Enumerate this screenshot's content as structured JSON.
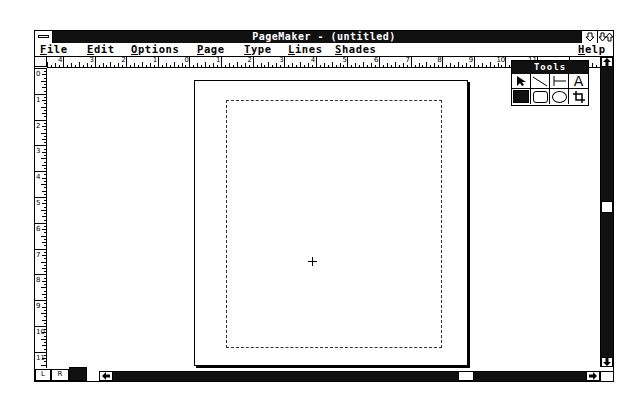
{
  "window": {
    "title": "PageMaker - (untitled)",
    "minimize_icon": "arrow-down",
    "maximize_icon": "arrows-up-down"
  },
  "menubar": {
    "items": [
      {
        "label": "File",
        "mnemonic": "F",
        "rest": "ile"
      },
      {
        "label": "Edit",
        "mnemonic": "E",
        "rest": "dit"
      },
      {
        "label": "Options",
        "mnemonic": "O",
        "rest": "ptions"
      },
      {
        "label": "Page",
        "mnemonic": "P",
        "rest": "age"
      },
      {
        "label": "Type",
        "mnemonic": "T",
        "rest": "ype"
      },
      {
        "label": "Lines",
        "mnemonic": "L",
        "rest": "ines"
      },
      {
        "label": "Shades",
        "mnemonic": "S",
        "rest": "hades"
      },
      {
        "label": "Help",
        "mnemonic": "H",
        "rest": "elp"
      }
    ]
  },
  "rulers": {
    "horizontal_labels": [
      "4",
      "3",
      "2",
      "1",
      "0",
      "1",
      "2",
      "3",
      "4",
      "5",
      "6",
      "7",
      "8",
      "9",
      "10",
      "11"
    ],
    "vertical_labels": [
      "0",
      "1",
      "2",
      "3",
      "4",
      "5",
      "6",
      "7",
      "8",
      "9",
      "10",
      "11"
    ]
  },
  "toolbox": {
    "title": "Tools",
    "tools": [
      {
        "name": "pointer",
        "glyph": "➤"
      },
      {
        "name": "diagonal-line",
        "glyph": "╲"
      },
      {
        "name": "perpendicular-line",
        "glyph": "├─"
      },
      {
        "name": "text",
        "glyph": "A"
      },
      {
        "name": "square-corner-rectangle",
        "glyph": "■"
      },
      {
        "name": "rounded-rectangle",
        "glyph": "▢"
      },
      {
        "name": "oval",
        "glyph": "◯"
      },
      {
        "name": "crop",
        "glyph": "⌗"
      }
    ]
  },
  "page_icons": {
    "left": "L",
    "right": "R"
  },
  "scroll": {
    "up_arrow": "▲",
    "down_arrow": "▼",
    "left_arrow": "◀",
    "right_arrow": "▶"
  }
}
